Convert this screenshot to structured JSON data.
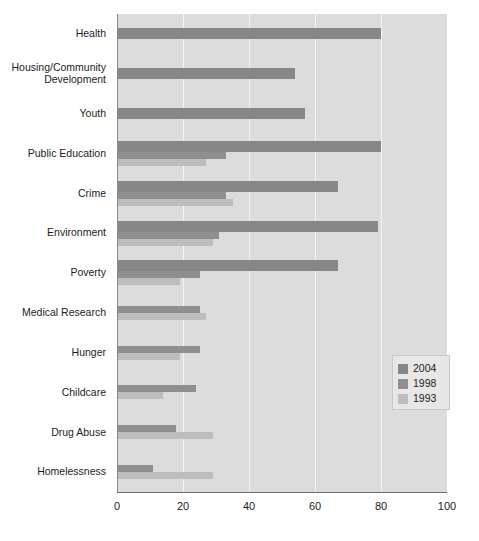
{
  "chart_data": {
    "type": "bar",
    "orientation": "horizontal",
    "title": "",
    "subtitle": "",
    "xlabel": "",
    "ylabel": "",
    "xlim": [
      0,
      100
    ],
    "xticks": [
      0,
      20,
      40,
      60,
      80,
      100
    ],
    "xtick_labels": [
      "0",
      "20",
      "40",
      "60",
      "80",
      "100"
    ],
    "grid": true,
    "grid_axis": "x",
    "legend_position": "right-middle",
    "categories": [
      "Health",
      "Housing/Community\nDevelopment",
      "Youth",
      "Public Education",
      "Crime",
      "Environment",
      "Poverty",
      "Medical Research",
      "Hunger",
      "Childcare",
      "Drug Abuse",
      "Homelessness"
    ],
    "series": [
      {
        "name": "2004",
        "color": "#878787",
        "values": [
          80,
          54,
          57,
          80,
          67,
          79,
          67,
          null,
          null,
          null,
          null,
          null
        ]
      },
      {
        "name": "1998",
        "color": "#8f8f8f",
        "values": [
          null,
          null,
          null,
          33,
          33,
          31,
          25,
          25,
          25,
          24,
          18,
          11
        ]
      },
      {
        "name": "1993",
        "color": "#bdbdbd",
        "values": [
          null,
          null,
          null,
          27,
          35,
          29,
          19,
          27,
          19,
          14,
          29,
          29
        ]
      }
    ]
  },
  "legend": {
    "entries": [
      {
        "label": "2004",
        "color": "#878787"
      },
      {
        "label": "1998",
        "color": "#8f8f8f"
      },
      {
        "label": "1993",
        "color": "#bdbdbd"
      }
    ]
  },
  "colors": {
    "plot_background": "#dcdcdc",
    "gridline": "#f4f4f4",
    "axis_line": "#6e6e6e",
    "text": "#1d1d1d",
    "legend_background": "#e7e7e7"
  }
}
